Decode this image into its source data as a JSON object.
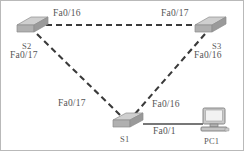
{
  "diagram": {
    "type": "network-topology",
    "background_color": "#ffffff",
    "line_color": "#3a3a3a",
    "device_fill_color": "#b4b4b4",
    "device_top_color": "#cfcfcf",
    "text_color": "#555555",
    "devices": [
      {
        "id": "S2",
        "label": "S2",
        "kind": "switch",
        "x": 30,
        "y": 27
      },
      {
        "id": "S3",
        "label": "S3",
        "kind": "switch",
        "x": 208,
        "y": 27
      },
      {
        "id": "S1",
        "label": "S1",
        "kind": "switch",
        "x": 126,
        "y": 122
      },
      {
        "id": "PC1",
        "label": "PC1",
        "kind": "computer",
        "x": 213,
        "y": 118
      }
    ],
    "links": [
      {
        "from": "S2",
        "to": "S3",
        "style": "dashed",
        "from_port": "Fa0/16",
        "to_port": "Fa0/17"
      },
      {
        "from": "S2",
        "to": "S1",
        "style": "dashed",
        "from_port": "Fa0/17",
        "to_port": "Fa0/17"
      },
      {
        "from": "S3",
        "to": "S1",
        "style": "dashed",
        "from_port": "Fa0/16",
        "to_port": "Fa0/16"
      },
      {
        "from": "S1",
        "to": "PC1",
        "style": "solid",
        "from_port": "Fa0/1",
        "to_port": ""
      }
    ],
    "port_labels": [
      {
        "id": "s2-top",
        "text": "Fa0/16",
        "x": 52,
        "y": 8
      },
      {
        "id": "s3-top",
        "text": "Fa0/17",
        "x": 160,
        "y": 8
      },
      {
        "id": "s2-side",
        "text": "Fa0/17",
        "x": 9,
        "y": 50
      },
      {
        "id": "s3-side",
        "text": "Fa0/16",
        "x": 193,
        "y": 50
      },
      {
        "id": "s1-left",
        "text": "Fa0/17",
        "x": 57,
        "y": 98
      },
      {
        "id": "s1-right",
        "text": "Fa0/16",
        "x": 151,
        "y": 99
      },
      {
        "id": "s1-pc1",
        "text": "Fa0/1",
        "x": 152,
        "y": 126
      }
    ],
    "device_labels": [
      {
        "id": "s2-name",
        "text": "S2",
        "x": 21,
        "y": 41
      },
      {
        "id": "s3-name",
        "text": "S3",
        "x": 211,
        "y": 41
      },
      {
        "id": "s1-name",
        "text": "S1",
        "x": 119,
        "y": 134
      },
      {
        "id": "pc1-name",
        "text": "PC1",
        "x": 203,
        "y": 136
      }
    ]
  }
}
